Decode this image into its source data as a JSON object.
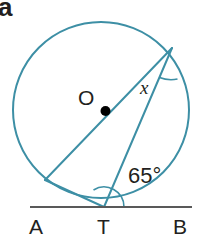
{
  "figure": {
    "part_label": "a",
    "type": "circle-geometry-diagram",
    "background": "#ffffff",
    "stroke_color": "#3d8fa5",
    "line_color": "#595959",
    "text_color": "#231f20",
    "width": 203,
    "height": 247
  },
  "labels": {
    "point_A": "A",
    "point_T": "T",
    "point_B": "B",
    "center_O": "O",
    "unknown_angle": "x",
    "known_angle": "65°"
  },
  "icons": {
    "center_dot": "center-point-dot",
    "angle_arc_x": "angle-arc-icon",
    "angle_arc_65": "angle-arc-icon"
  },
  "geometry": {
    "circle": {
      "cx": 101,
      "cy": 110,
      "r": 88
    },
    "tangent_line": {
      "x1": 30,
      "y1": 207,
      "x2": 192,
      "y2": 207
    },
    "tangent_point_T": {
      "x": 104,
      "y": 207
    },
    "point_P_top_right": {
      "x": 172,
      "y": 48
    },
    "point_Q_lower_left": {
      "x": 45,
      "y": 180
    },
    "diameter": {
      "from": "point_Q_lower_left",
      "to": "point_P_top_right",
      "through": "center_O"
    },
    "chords": [
      {
        "from": "tangent_point_T",
        "to": "point_P_top_right"
      },
      {
        "from": "tangent_point_T",
        "to": "point_Q_lower_left"
      }
    ]
  }
}
